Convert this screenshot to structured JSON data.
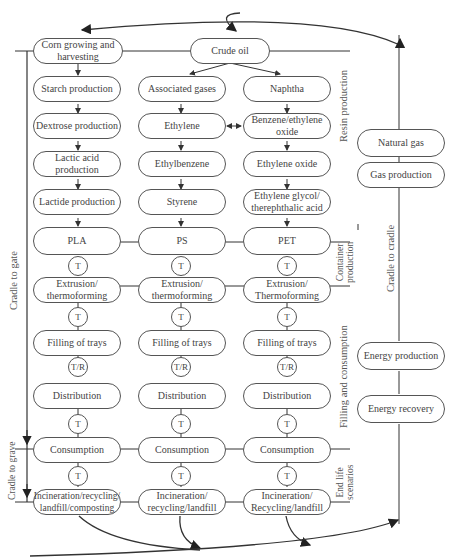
{
  "diagram": {
    "type": "life-cycle-flowchart",
    "top_nodes": {
      "corn": "Corn growing and\nharvesting",
      "crude_oil": "Crude oil"
    },
    "columns": {
      "pla": [
        "Starch production",
        "Dextrose production",
        "Lactic acid\nproduction",
        "Lactide production",
        "PLA",
        "Extrusion/\nthermoforming",
        "Filling of trays",
        "Distribution",
        "Consumption",
        "Incineration/recycling/\nlandfill/composting"
      ],
      "ps": [
        "Associated gases",
        "Ethylene",
        "Ethylbenzene",
        "Styrene",
        "PS",
        "Extrusion/\nthermoforming",
        "Filling of trays",
        "Distribution",
        "Consumption",
        "Incineration/\nrecycling/landfill"
      ],
      "pet": [
        "Naphtha",
        "Benzene/ethylene\noxide",
        "Ethylene oxide",
        "Ethylene glycol/\ntherephthalic acid",
        "PET",
        "Extrusion/\nThermoforming",
        "Filling of trays",
        "Distribution",
        "Consumption",
        "Incineration/\nRecycling/landfill"
      ]
    },
    "transport_markers": [
      "T",
      "T",
      "T/R",
      "T",
      "T"
    ],
    "energy_nodes": {
      "natural_gas": "Natural gas",
      "gas_production": "Gas production",
      "energy_production": "Energy production",
      "energy_recovery": "Energy recovery"
    },
    "stage_labels": {
      "resin": "Resin production",
      "container": "Container\nproduction",
      "filling": "Filling and consumption",
      "end_life": "End life\nscenarios"
    },
    "boundary_labels": {
      "cradle_to_gate": "Cradle to gate",
      "cradle_to_grave": "Cradle to grave",
      "cradle_to_cradle": "Cradle to cradle"
    },
    "colors": {
      "line": "#333333",
      "box_border": "#555555",
      "text": "#444444"
    }
  }
}
